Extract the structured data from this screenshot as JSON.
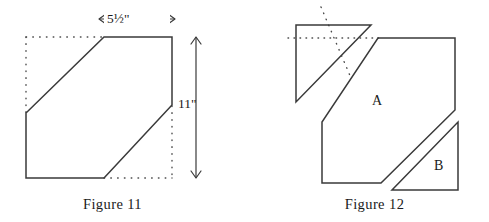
{
  "figures": [
    {
      "caption": "Figure 11",
      "dimensions": {
        "width_label": "5½\"",
        "width_value": 5.5,
        "height_label": "11\"",
        "height_value": 11,
        "units": "inches"
      },
      "shape": {
        "name": "hexagon",
        "description": "rectangle with two opposite corners cut off",
        "solid_outline_points": "104,37 172,37 172,105 104,178 26,178 26,113",
        "bounding_box_dotted_points": "26,37 172,37 172,178 26,178"
      }
    },
    {
      "caption": "Figure 12",
      "pieces": [
        {
          "label": "A",
          "name": "hexagon-piece-a"
        },
        {
          "label": "B",
          "name": "triangle-piece-b"
        },
        {
          "label": "",
          "name": "triangle-piece-detached-top"
        }
      ],
      "geometry": {
        "hexagon_a_points": "378,38 455,38 455,110 381,183 322,183 322,122",
        "triangle_top_points": "296,25 371,25 296,102",
        "triangle_b_points": "458,122 458,190 392,190",
        "dotted_horizontal": "288,38 384,38",
        "dotted_diagonal": "321,7 350,76"
      }
    }
  ],
  "style": {
    "stroke_color": "#3a3a3a",
    "dot_color": "#4a4a4a",
    "background": "#ffffff",
    "text_color": "#1a1a1a"
  }
}
